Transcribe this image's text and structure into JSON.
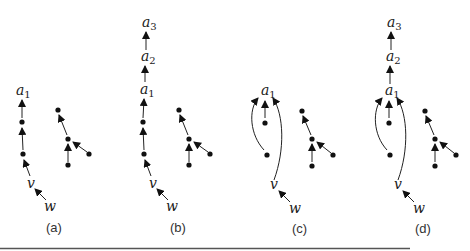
{
  "figure": {
    "panels": [
      {
        "caption": "(a)",
        "chain_labels": [
          {
            "name": "a",
            "sub": "1"
          }
        ],
        "v": "v",
        "w": "w"
      },
      {
        "caption": "(b)",
        "chain_labels": [
          {
            "name": "a",
            "sub": "1"
          },
          {
            "name": "a",
            "sub": "2"
          },
          {
            "name": "a",
            "sub": "3"
          }
        ],
        "v": "v",
        "w": "w"
      },
      {
        "caption": "(c)",
        "chain_labels": [
          {
            "name": "a",
            "sub": "1"
          }
        ],
        "v": "v",
        "w": "w"
      },
      {
        "caption": "(d)",
        "chain_labels": [
          {
            "name": "a",
            "sub": "1"
          },
          {
            "name": "a",
            "sub": "2"
          },
          {
            "name": "a",
            "sub": "3"
          }
        ],
        "v": "v",
        "w": "w"
      }
    ],
    "colors": {
      "ink": "#1a1a1a",
      "rule": "#555555"
    }
  }
}
